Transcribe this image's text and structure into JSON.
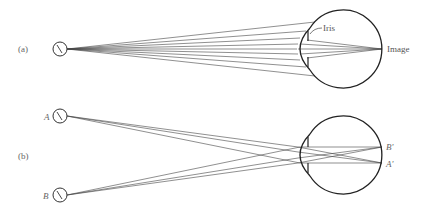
{
  "diagram": {
    "panel_a": {
      "label": "(a)",
      "source_glyph": "\\",
      "labels": {
        "iris": "Iris",
        "image": "Image"
      }
    },
    "panel_b": {
      "label": "(b)",
      "source_a_label": "A",
      "source_b_label": "B",
      "source_glyph": "\\",
      "image_labels": {
        "b_prime": "B'",
        "a_prime": "A'"
      }
    },
    "colors": {
      "line": "#333333",
      "eye_outline": "#222222",
      "label": "#555555"
    }
  }
}
